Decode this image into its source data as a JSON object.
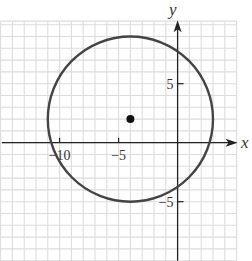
{
  "chart_data": {
    "type": "scatter",
    "title": "",
    "xlabel": "x",
    "ylabel": "y",
    "xlim": [
      -15,
      5
    ],
    "ylim": [
      -10,
      10.3
    ],
    "grid": true,
    "grid_step": 1,
    "x_ticks": [
      {
        "value": -10,
        "label": "−10"
      },
      {
        "value": -5,
        "label": "−5"
      }
    ],
    "y_ticks": [
      {
        "value": 5,
        "label": "5"
      },
      {
        "value": -5,
        "label": "−5"
      }
    ],
    "circle": {
      "center": [
        -4,
        2
      ],
      "radius": 7
    },
    "points": [
      {
        "x": -4,
        "y": 2,
        "label": "center"
      }
    ]
  },
  "colors": {
    "grid": "#dcdcdc",
    "axis": "#222222",
    "curve": "#444444",
    "point": "#111111"
  }
}
